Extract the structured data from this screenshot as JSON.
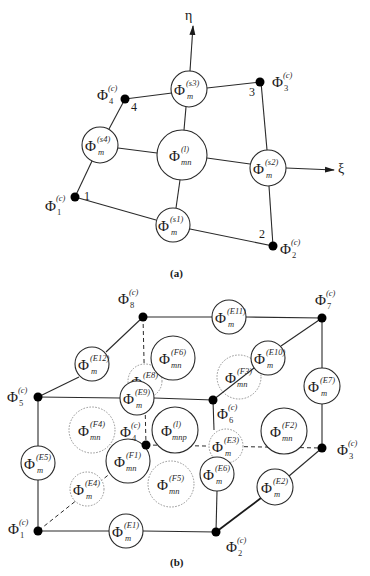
{
  "figure_a": {
    "caption": "(a)",
    "axes": {
      "eta": "η",
      "xi": "ξ"
    },
    "corner_nodes": [
      {
        "id": "1",
        "number": "1",
        "symbol": "Φ",
        "sup": "(c)",
        "sub": "1"
      },
      {
        "id": "2",
        "number": "2",
        "symbol": "Φ",
        "sup": "(c)",
        "sub": "2"
      },
      {
        "id": "3",
        "number": "3",
        "symbol": "Φ",
        "sup": "(c)",
        "sub": "3"
      },
      {
        "id": "4",
        "number": "4",
        "symbol": "Φ",
        "sup": "(c)",
        "sub": "4"
      }
    ],
    "side_modes": [
      {
        "id": "s1",
        "symbol": "Φ",
        "sup": "(s1)",
        "sub": "m"
      },
      {
        "id": "s2",
        "symbol": "Φ",
        "sup": "(s2)",
        "sub": "m"
      },
      {
        "id": "s3",
        "symbol": "Φ",
        "sup": "(s3)",
        "sub": "m"
      },
      {
        "id": "s4",
        "symbol": "Φ",
        "sup": "(s4)",
        "sub": "m"
      }
    ],
    "interior_mode": {
      "id": "l",
      "symbol": "Φ",
      "sup": "(l)",
      "sub": "mn"
    }
  },
  "figure_b": {
    "caption": "(b)",
    "corner_nodes": [
      {
        "id": "1",
        "symbol": "Φ",
        "sup": "(c)",
        "sub": "1"
      },
      {
        "id": "2",
        "symbol": "Φ",
        "sup": "(c)",
        "sub": "2"
      },
      {
        "id": "3",
        "symbol": "Φ",
        "sup": "(c)",
        "sub": "3"
      },
      {
        "id": "4",
        "symbol": "Φ",
        "sup": "(c)",
        "sub": "4"
      },
      {
        "id": "5",
        "symbol": "Φ",
        "sup": "(c)",
        "sub": "5"
      },
      {
        "id": "6",
        "symbol": "Φ",
        "sup": "(c)",
        "sub": "6"
      },
      {
        "id": "7",
        "symbol": "Φ",
        "sup": "(c)",
        "sub": "7"
      },
      {
        "id": "8",
        "symbol": "Φ",
        "sup": "(c)",
        "sub": "8"
      }
    ],
    "edge_modes": [
      {
        "id": "E1",
        "symbol": "Φ",
        "sup": "(E1)",
        "sub": "m",
        "hidden": false
      },
      {
        "id": "E2",
        "symbol": "Φ",
        "sup": "(E2)",
        "sub": "m",
        "hidden": false
      },
      {
        "id": "E3",
        "symbol": "Φ",
        "sup": "(E3)",
        "sub": "m",
        "hidden": true
      },
      {
        "id": "E4",
        "symbol": "Φ",
        "sup": "(E4)",
        "sub": "m",
        "hidden": true
      },
      {
        "id": "E5",
        "symbol": "Φ",
        "sup": "(E5)",
        "sub": "m",
        "hidden": false
      },
      {
        "id": "E6",
        "symbol": "Φ",
        "sup": "(E6)",
        "sub": "m",
        "hidden": false
      },
      {
        "id": "E7",
        "symbol": "Φ",
        "sup": "(E7)",
        "sub": "m",
        "hidden": false
      },
      {
        "id": "E8",
        "symbol": "Φ",
        "sup": "(E8)",
        "sub": "m",
        "hidden": true
      },
      {
        "id": "E9",
        "symbol": "Φ",
        "sup": "(E9)",
        "sub": "m",
        "hidden": false
      },
      {
        "id": "E10",
        "symbol": "Φ",
        "sup": "(E10)",
        "sub": "m",
        "hidden": false
      },
      {
        "id": "E11",
        "symbol": "Φ",
        "sup": "(E11)",
        "sub": "m",
        "hidden": false
      },
      {
        "id": "E12",
        "symbol": "Φ",
        "sup": "(E12)",
        "sub": "m",
        "hidden": false
      }
    ],
    "face_modes": [
      {
        "id": "F1",
        "symbol": "Φ",
        "sup": "(F1)",
        "sub": "mn",
        "hidden": false
      },
      {
        "id": "F2",
        "symbol": "Φ",
        "sup": "(F2)",
        "sub": "mn",
        "hidden": false
      },
      {
        "id": "F3",
        "symbol": "Φ",
        "sup": "(F3)",
        "sub": "mn",
        "hidden": true
      },
      {
        "id": "F4",
        "symbol": "Φ",
        "sup": "(F4)",
        "sub": "mn",
        "hidden": true
      },
      {
        "id": "F5",
        "symbol": "Φ",
        "sup": "(F5)",
        "sub": "mn",
        "hidden": true
      },
      {
        "id": "F6",
        "symbol": "Φ",
        "sup": "(F6)",
        "sub": "mn",
        "hidden": false
      }
    ],
    "interior_mode": {
      "id": "l",
      "symbol": "Φ",
      "sup": "(l)",
      "sub": "mnp"
    }
  }
}
